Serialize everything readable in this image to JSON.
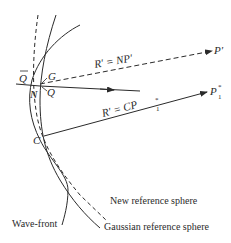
{
  "diagram": {
    "type": "optics-wavefront-reference-spheres",
    "points": {
      "Q_bar": "Q",
      "G": "G",
      "N": "N",
      "Q": "Q",
      "C": "C",
      "P_prime": "P′",
      "P1_star": "P",
      "P1_star_sup": "*",
      "P1_star_sub": "1"
    },
    "rays": {
      "upper": {
        "label": "R′ = NP′",
        "style": "dashed"
      },
      "lower": {
        "label": "R′ = CP",
        "label_sup": "*",
        "label_sub": "1",
        "style": "solid"
      }
    },
    "curves": {
      "new_reference_sphere": "New reference sphere",
      "gaussian_reference_sphere": "Gaussian reference sphere",
      "wave_front": "Wave-front"
    },
    "colors": {
      "line": "#2a2a2a",
      "background": "#ffffff"
    }
  }
}
